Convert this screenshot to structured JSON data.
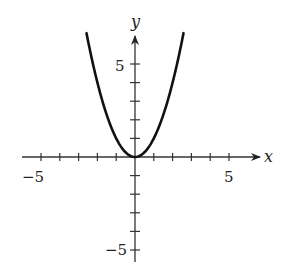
{
  "chart_data": {
    "type": "line",
    "title": "",
    "xlabel": "x",
    "ylabel": "y",
    "xlim": [
      -5.8,
      6.7
    ],
    "ylim": [
      -6.0,
      6.3
    ],
    "grid": false,
    "legend": null,
    "x_tick_labels": [
      {
        "value": -5,
        "label": "−5"
      },
      {
        "value": 5,
        "label": "5"
      }
    ],
    "y_tick_labels": [
      {
        "value": 5,
        "label": "5"
      },
      {
        "value": -5,
        "label": "−5"
      }
    ],
    "x_ticks": [
      -5,
      -4,
      -3,
      -2,
      -1,
      1,
      2,
      3,
      4,
      5
    ],
    "y_ticks": [
      -5,
      -4,
      -3,
      -2,
      -1,
      1,
      2,
      3,
      4,
      5
    ],
    "series": [
      {
        "name": "y = x^2",
        "function": "x^2",
        "x": [
          -2.5,
          -2,
          -1.5,
          -1,
          -0.5,
          0,
          0.5,
          1,
          1.5,
          2,
          2.5
        ],
        "values": [
          6.25,
          4,
          2.25,
          1,
          0.25,
          0,
          0.25,
          1,
          2.25,
          4,
          6.25
        ]
      }
    ]
  },
  "labels": {
    "x_axis": "x",
    "y_axis": "y",
    "x_neg5": "−5",
    "x_pos5": "5",
    "y_pos5": "5",
    "y_neg5": "−5"
  },
  "colors": {
    "curve": "#111111",
    "axis": "#333333"
  }
}
